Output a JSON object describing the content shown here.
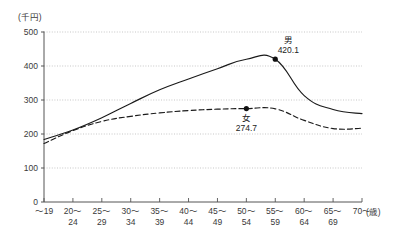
{
  "chart_data": {
    "type": "line",
    "title": "",
    "xlabel": "(歳)",
    "ylabel": "(千円)",
    "ylim": [
      0,
      500
    ],
    "ytick_step": 100,
    "grid": true,
    "legend_position": "inline-annotation",
    "categories": [
      "～19",
      "20～\n24",
      "25～\n29",
      "30～\n34",
      "35～\n39",
      "40～\n44",
      "45～\n49",
      "50～\n54",
      "55～\n59",
      "60～\n64",
      "65～\n69",
      "70～"
    ],
    "category_lines": [
      [
        "～19",
        ""
      ],
      [
        "20～",
        "24"
      ],
      [
        "25～",
        "29"
      ],
      [
        "30～",
        "34"
      ],
      [
        "35～",
        "39"
      ],
      [
        "40～",
        "44"
      ],
      [
        "45～",
        "49"
      ],
      [
        "50～",
        "54"
      ],
      [
        "55～",
        "59"
      ],
      [
        "60～",
        "64"
      ],
      [
        "65～",
        "69"
      ],
      [
        "70～",
        ""
      ]
    ],
    "yticks": [
      "500",
      "400",
      "300",
      "200",
      "100",
      "0"
    ],
    "ytick_values": [
      500,
      400,
      300,
      200,
      100,
      0
    ],
    "series": [
      {
        "name": "男",
        "style": "solid",
        "color": "#1a1a1a",
        "values": [
          184,
          212,
          248,
          290,
          330,
          362,
          392,
          420,
          420.1,
          313,
          272,
          260
        ],
        "marker_index": 8,
        "marker_label": "男",
        "marker_value": "420.1"
      },
      {
        "name": "女",
        "style": "dashed",
        "color": "#1a1a1a",
        "values": [
          172,
          210,
          237,
          252,
          262,
          269,
          273,
          274.7,
          274,
          240,
          216,
          217
        ],
        "marker_index": 7,
        "marker_label": "女",
        "marker_value": "274.7"
      }
    ]
  },
  "annotations": {
    "male": {
      "label": "男",
      "value": "420.1"
    },
    "female": {
      "label": "女",
      "value": "274.7"
    }
  },
  "axis": {
    "y_unit": "(千円)",
    "x_unit": "(歳)"
  },
  "colors": {
    "line": "#1a1a1a",
    "grid": "#b9b9b9",
    "axis": "#555555",
    "text": "#3a3a3a"
  }
}
